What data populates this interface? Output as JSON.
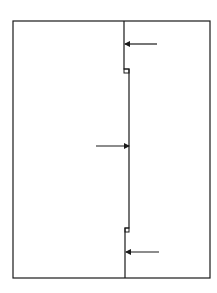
{
  "diagram": {
    "width": 217,
    "height": 293,
    "stroke_color": "#1a1a1a",
    "outer_frame": {
      "x": 13,
      "y": 21,
      "w": 197,
      "h": 257
    },
    "divider_path": "M124,21 L124,69 L129,69 L129,73 L129,228 L125,228 L125,232 L125,278",
    "notches": [
      {
        "x": 124,
        "y": 69,
        "w": 5,
        "h": 4
      },
      {
        "x": 125,
        "y": 228,
        "w": 4,
        "h": 4
      }
    ],
    "arrows": [
      {
        "name": "arrow-top-right",
        "x1": 157,
        "y1": 44,
        "x2": 125,
        "y2": 44
      },
      {
        "name": "arrow-middle-left",
        "x1": 96,
        "y1": 146,
        "x2": 129,
        "y2": 146
      },
      {
        "name": "arrow-bottom-right",
        "x1": 159,
        "y1": 252,
        "x2": 126,
        "y2": 252
      }
    ]
  }
}
